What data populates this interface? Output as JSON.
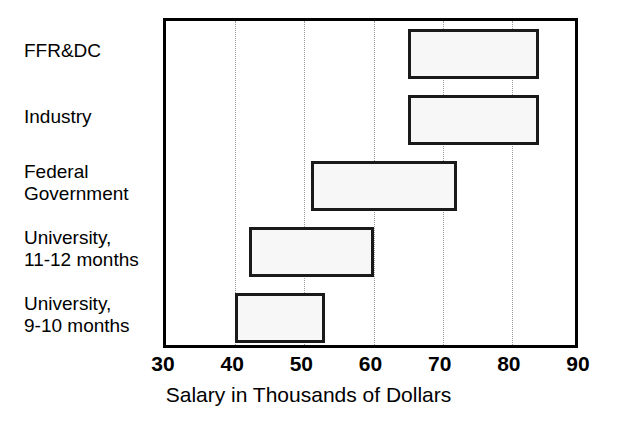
{
  "chart_data": {
    "type": "bar",
    "subtype": "horizontal-range-bar",
    "title": "",
    "subtitle": "",
    "xlabel": "Salary in Thousands of Dollars",
    "ylabel": "",
    "xlim": [
      30,
      90
    ],
    "xticks": [
      30,
      40,
      50,
      60,
      70,
      80,
      90
    ],
    "xtick_labels": [
      "30",
      "40",
      "50",
      "60",
      "70",
      "80",
      "90"
    ],
    "gridlines": {
      "vertical_at": [
        40,
        50,
        60,
        70,
        80
      ],
      "style": "dotted",
      "color": "#9a9a9a",
      "horizontal": false
    },
    "legend": {
      "visible": false,
      "position": "none"
    },
    "annotations": [],
    "categories": [
      "FFR&DC",
      "Industry",
      "Federal\nGovernment",
      "University,\n11-12 months",
      "University,\n9-10 months"
    ],
    "bars": [
      {
        "category": "FFR&DC",
        "low": 65,
        "high": 84,
        "fill": "#f7f7f7",
        "edge": "#1a1a1a"
      },
      {
        "category": "Industry",
        "low": 65,
        "high": 84,
        "fill": "#f7f7f7",
        "edge": "#1a1a1a"
      },
      {
        "category": "Federal Government",
        "low": 51,
        "high": 72,
        "fill": "#f7f7f7",
        "edge": "#1a1a1a"
      },
      {
        "category": "University, 11-12 months",
        "low": 42,
        "high": 60,
        "fill": "#f7f7f7",
        "edge": "#1a1a1a"
      },
      {
        "category": "University, 9-10 months",
        "low": 40,
        "high": 53,
        "fill": "#f7f7f7",
        "edge": "#1a1a1a"
      }
    ],
    "colors": {
      "bar_fill": "#f7f7f7",
      "bar_edge": "#1a1a1a",
      "frame": "#000000",
      "grid": "#9a9a9a",
      "background": "#ffffff",
      "text": "#000000"
    }
  }
}
